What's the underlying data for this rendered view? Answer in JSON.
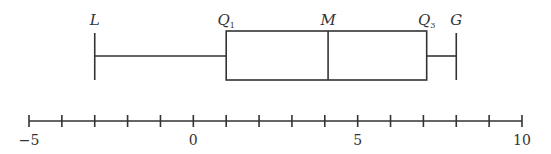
{
  "chart_data": {
    "type": "boxplot",
    "title": "",
    "xlabel": "",
    "ylabel": "",
    "xlim": [
      -5,
      10
    ],
    "ticks": [
      -5,
      -4,
      -3,
      -2,
      -1,
      0,
      1,
      2,
      3,
      4,
      5,
      6,
      7,
      8,
      9,
      10
    ],
    "tick_labels": [
      {
        "value": -5,
        "text": "−5"
      },
      {
        "value": 0,
        "text": "0"
      },
      {
        "value": 5,
        "text": "5"
      },
      {
        "value": 10,
        "text": "10"
      }
    ],
    "box": {
      "min": -3,
      "q1": 1,
      "median": 4.1,
      "q3": 7.1,
      "max": 8
    },
    "annotations": [
      {
        "key": "min",
        "letter": "L",
        "sub": ""
      },
      {
        "key": "q1",
        "letter": "Q",
        "sub": "1"
      },
      {
        "key": "median",
        "letter": "M",
        "sub": ""
      },
      {
        "key": "q3",
        "letter": "Q",
        "sub": "3"
      },
      {
        "key": "max",
        "letter": "G",
        "sub": ""
      }
    ],
    "grid": false
  }
}
